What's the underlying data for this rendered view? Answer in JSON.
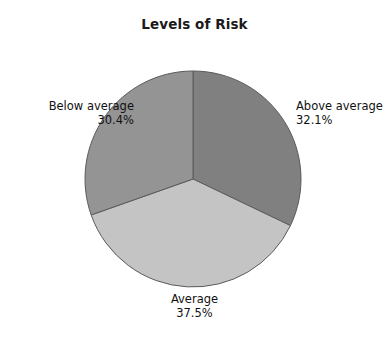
{
  "chart_data": {
    "type": "pie",
    "title": "Levels of Risk",
    "xlabel": "",
    "ylabel": "",
    "legend_position": "none",
    "grid": false,
    "labels_outside": true,
    "start_angle_deg": 0,
    "direction": "clockwise",
    "categories": [
      "Above average",
      "Average",
      "Below average"
    ],
    "values": [
      32.1,
      37.5,
      30.4
    ],
    "value_labels": [
      "32.1%",
      "37.5%",
      "30.4%"
    ],
    "colors": [
      "#808080",
      "#c4c4c4",
      "#949494"
    ],
    "slices": [
      {
        "name": "Above average",
        "value": 32.1,
        "value_label": "32.1%",
        "color": "#808080",
        "label_position": "right"
      },
      {
        "name": "Average",
        "value": 37.5,
        "value_label": "37.5%",
        "color": "#c4c4c4",
        "label_position": "bottom"
      },
      {
        "name": "Below average",
        "value": 30.4,
        "value_label": "30.4%",
        "color": "#949494",
        "label_position": "left"
      }
    ]
  },
  "chart": {
    "title": "Levels of Risk",
    "background_color": "#ffffff",
    "slice_border_color": "#5a5a5a"
  }
}
